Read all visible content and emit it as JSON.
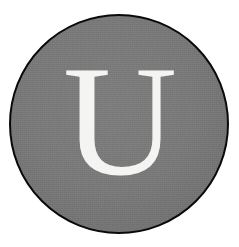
{
  "canvas": {
    "width": 239,
    "height": 247,
    "background_color": "#ffffff"
  },
  "badge": {
    "shape": "circle",
    "fill_color": "#787878",
    "outline_color": "#0a0a0a",
    "outline_width_px": 3,
    "diameter_px": 220,
    "center_x_px": 119,
    "center_y_px": 124
  },
  "monogram": {
    "letter": "U",
    "color": "#f4f4f2",
    "style": "serif",
    "cap_height_px": 111
  }
}
